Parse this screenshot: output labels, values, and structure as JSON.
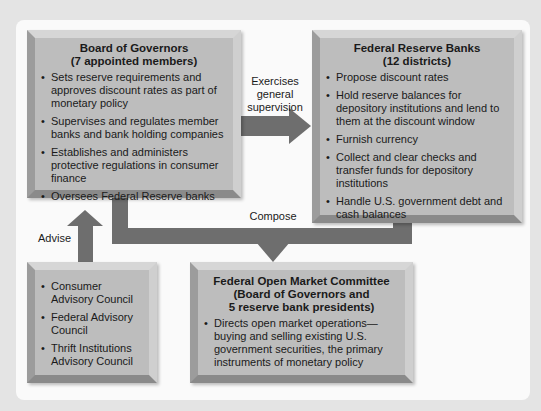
{
  "diagram": {
    "board_of_governors": {
      "title_line1": "Board of Governors",
      "title_line2": "(7 appointed members)",
      "items": [
        "Sets reserve requirements and approves discount rates as part of monetary policy",
        "Supervises and regulates member banks and bank holding companies",
        "Establishes and administers protective regulations in consumer finance",
        "Oversees Federal Reserve banks"
      ]
    },
    "federal_reserve_banks": {
      "title_line1": "Federal Reserve Banks",
      "title_line2": "(12 districts)",
      "items": [
        "Propose discount rates",
        "Hold reserve balances for depository institutions and lend to them at the discount window",
        "Furnish currency",
        "Collect and clear checks and transfer funds for depository institutions",
        "Handle U.S. government debt and cash balances"
      ]
    },
    "advisory_councils": {
      "items": [
        "Consumer Advisory Council",
        "Federal Advisory Council",
        "Thrift Institutions Advisory Council"
      ]
    },
    "fomc": {
      "title_line1": "Federal Open Market Committee",
      "title_line2": "(Board of Governors and",
      "title_line3": "5 reserve bank presidents)",
      "items": [
        "Directs open market operations—buying and selling existing U.S. government securities, the primary instruments of monetary policy"
      ]
    },
    "arrows": {
      "supervision_label_line1": "Exercises",
      "supervision_label_line2": "general",
      "supervision_label_line3": "supervision",
      "compose_label": "Compose",
      "advise_label": "Advise"
    },
    "colors": {
      "box_fill": "#bdbdbd",
      "arrow": "#6e6e6e",
      "panel": "#fafafa",
      "background": "#e4e4e4"
    }
  }
}
